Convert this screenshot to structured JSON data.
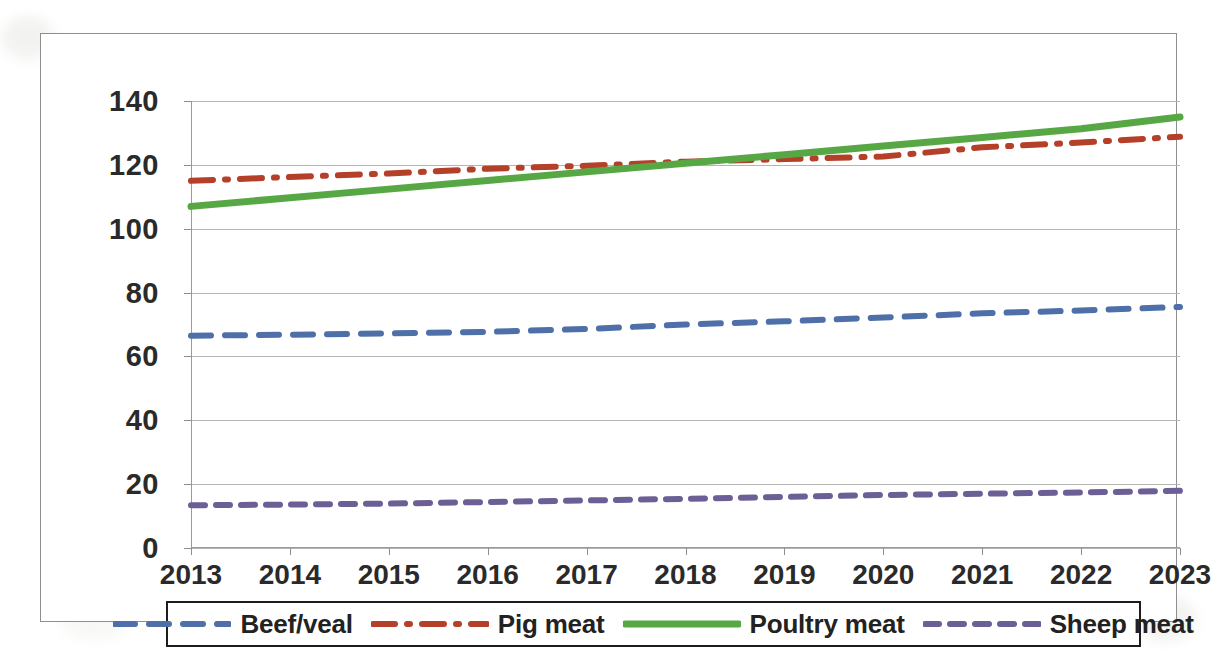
{
  "chart_data": {
    "type": "line",
    "title": "",
    "subtitle": "",
    "xlabel": "",
    "ylabel": "",
    "grid": true,
    "legend_position": "bottom",
    "xlim": [
      2013,
      2023
    ],
    "ylim": [
      0,
      140
    ],
    "ytick_step": 20,
    "x": [
      2013,
      2014,
      2015,
      2016,
      2017,
      2018,
      2019,
      2020,
      2021,
      2022,
      2023
    ],
    "categories": [
      "2013",
      "2014",
      "2015",
      "2016",
      "2017",
      "2018",
      "2019",
      "2020",
      "2021",
      "2022",
      "2023"
    ],
    "ytick_labels": [
      "0",
      "20",
      "40",
      "60",
      "80",
      "100",
      "120",
      "140"
    ],
    "ytick_values": [
      0,
      20,
      40,
      60,
      80,
      100,
      120,
      140
    ],
    "series": [
      {
        "name": "Beef/veal",
        "color": "#4f6fa8",
        "style": "dashed",
        "values": [
          66.5,
          66.8,
          67.2,
          67.7,
          68.6,
          70.0,
          71.0,
          72.2,
          73.5,
          74.4,
          75.5
        ]
      },
      {
        "name": "Pig meat",
        "color": "#b5402a",
        "style": "dash-dot",
        "values": [
          115.0,
          116.2,
          117.3,
          118.8,
          119.7,
          121.0,
          121.8,
          122.6,
          125.5,
          127.0,
          128.8
        ]
      },
      {
        "name": "Poultry meat",
        "color": "#57a845",
        "style": "solid",
        "values": [
          107.0,
          109.7,
          112.4,
          115.1,
          117.8,
          120.5,
          123.2,
          125.9,
          128.6,
          131.3,
          135.0
        ]
      },
      {
        "name": "Sheep meat",
        "color": "#6b5f96",
        "style": "dashed-short",
        "values": [
          13.4,
          13.6,
          13.9,
          14.4,
          14.9,
          15.4,
          16.0,
          16.6,
          17.0,
          17.4,
          17.9
        ]
      }
    ]
  },
  "legend": {
    "entries": [
      {
        "label": "Beef/veal",
        "color": "#4f6fa8",
        "style": "dashed"
      },
      {
        "label": "Pig meat",
        "color": "#b5402a",
        "style": "dash-dot"
      },
      {
        "label": "Poultry meat",
        "color": "#57a845",
        "style": "solid"
      },
      {
        "label": "Sheep meat",
        "color": "#6b5f96",
        "style": "dashed-short"
      }
    ]
  }
}
